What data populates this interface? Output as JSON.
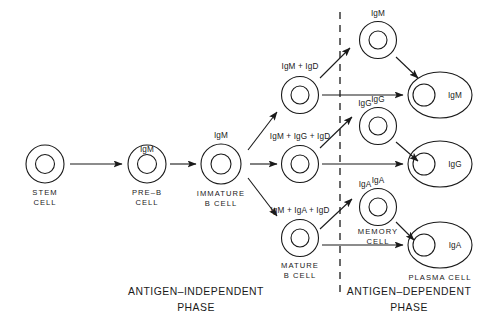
{
  "diagram": {
    "title_hidden": "",
    "phases": [
      {
        "id": "antigen-independent",
        "line1": "ANTIGEN–INDEPENDENT",
        "line2": "PHASE"
      },
      {
        "id": "antigen-dependent",
        "line1": "ANTIGEN–DEPENDENT",
        "line2": "PHASE"
      }
    ],
    "cells": [
      {
        "id": "stem-cell",
        "ig": "",
        "label1": "STEM",
        "label2": "CELL"
      },
      {
        "id": "pre-b-cell",
        "ig": "IgM",
        "label1": "PRE–B",
        "label2": "CELL"
      },
      {
        "id": "immature-b-cell",
        "ig": "IgM",
        "label1": "IMMATURE",
        "label2": "B CELL"
      },
      {
        "id": "igm-igd-cell",
        "ig": "IgM + IgD",
        "label1": "",
        "label2": ""
      },
      {
        "id": "igm-igg-igd-cell",
        "ig": "IgM + IgG + IgD",
        "label1": "",
        "label2": ""
      },
      {
        "id": "mature-b-cell",
        "ig": "IgM + IgA + IgD",
        "label1": "MATURE",
        "label2": "B CELL"
      },
      {
        "id": "memory-cell-igm",
        "ig": "IgM",
        "label1": "",
        "label2": ""
      },
      {
        "id": "memory-cell-igg",
        "ig": "IgG",
        "label1": "",
        "label2": ""
      },
      {
        "id": "memory-cell-iga",
        "ig": "IgA",
        "label1": "MEMORY",
        "label2": "CELL"
      },
      {
        "id": "plasma-cell-igm",
        "ig": "IgM",
        "label1": "",
        "label2": ""
      },
      {
        "id": "plasma-cell-igg",
        "ig": "IgG",
        "label1": "",
        "label2": ""
      },
      {
        "id": "plasma-cell-iga",
        "ig": "IgA",
        "label1": "PLASMA CELL",
        "label2": ""
      }
    ],
    "arrow_labels": [
      {
        "id": "igg-arrow-label",
        "text": "IgG"
      },
      {
        "id": "iga-arrow-label",
        "text": "IgA"
      }
    ],
    "colors": {
      "ink": "#1a1a1a",
      "background": "#ffffff"
    }
  }
}
